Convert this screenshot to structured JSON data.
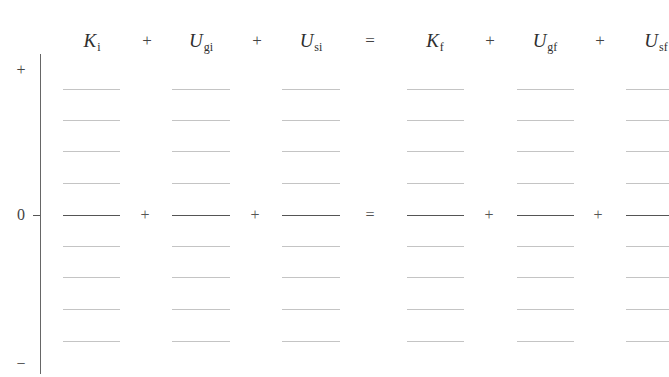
{
  "header": {
    "terms": [
      {
        "symbol": "K",
        "subscript": "i",
        "x": 92
      },
      {
        "symbol": "U",
        "subscript": "gi",
        "x": 201
      },
      {
        "symbol": "U",
        "subscript": "si",
        "x": 311
      },
      {
        "symbol": "K",
        "subscript": "f",
        "x": 435
      },
      {
        "symbol": "U",
        "subscript": "gf",
        "x": 545
      },
      {
        "symbol": "U",
        "subscript": "sf",
        "x": 656
      }
    ],
    "operators": [
      {
        "label": "+",
        "x": 147
      },
      {
        "label": "+",
        "x": 257
      },
      {
        "label": "=",
        "x": 370
      },
      {
        "label": "+",
        "x": 490
      },
      {
        "label": "+",
        "x": 600
      }
    ]
  },
  "axis": {
    "top_label": "+",
    "zero_label": "0",
    "bottom_label": "−"
  },
  "grid": {
    "columns": [
      {
        "name": "K_i",
        "x1": 63,
        "x2": 120
      },
      {
        "name": "U_gi",
        "x1": 172,
        "x2": 230
      },
      {
        "name": "U_si",
        "x1": 282,
        "x2": 340
      },
      {
        "name": "K_f",
        "x1": 407,
        "x2": 464
      },
      {
        "name": "U_gf",
        "x1": 517,
        "x2": 574
      },
      {
        "name": "U_sf",
        "x1": 626,
        "x2": 669
      }
    ],
    "rows_y": [
      89,
      120,
      151,
      183,
      215,
      246,
      277,
      309,
      341
    ],
    "zero_row_index": 4
  },
  "zero_row_operators": [
    {
      "label": "+",
      "x": 145
    },
    {
      "label": "+",
      "x": 255
    },
    {
      "label": "=",
      "x": 370
    },
    {
      "label": "+",
      "x": 489
    },
    {
      "label": "+",
      "x": 598
    }
  ]
}
